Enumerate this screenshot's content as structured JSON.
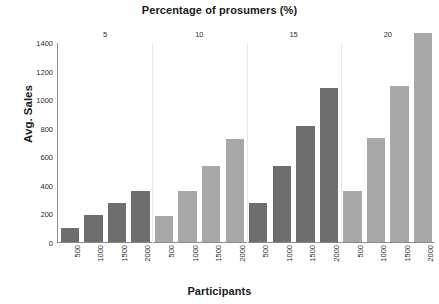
{
  "chart_data": {
    "type": "bar",
    "title": "Percentage of prosumers (%)",
    "xlabel": "Participants",
    "ylabel": "Avg. Sales",
    "ylim": [
      0,
      1400
    ],
    "yticks": [
      0,
      200,
      400,
      600,
      800,
      1000,
      1200,
      1400
    ],
    "grid": false,
    "legend": "none",
    "group_axis_label": "Percentage of prosumers (%)",
    "group_labels": [
      "5",
      "10",
      "15",
      "20"
    ],
    "categories": [
      "500",
      "1000",
      "1500",
      "2000"
    ],
    "groups": [
      {
        "name": "5",
        "color": "#6e6e6e",
        "categories": [
          "500",
          "1000",
          "1500",
          "2000"
        ],
        "values": [
          100,
          190,
          270,
          360
        ]
      },
      {
        "name": "10",
        "color": "#a8a8a8",
        "categories": [
          "500",
          "1000",
          "1500",
          "2000"
        ],
        "values": [
          185,
          360,
          530,
          720
        ]
      },
      {
        "name": "15",
        "color": "#6e6e6e",
        "categories": [
          "500",
          "1000",
          "1500",
          "2000"
        ],
        "values": [
          270,
          530,
          810,
          1080
        ]
      },
      {
        "name": "20",
        "color": "#a8a8a8",
        "categories": [
          "500",
          "1000",
          "1500",
          "2000"
        ],
        "values": [
          360,
          730,
          1090,
          1460
        ]
      }
    ],
    "colors": {
      "dark_bar": "#6e6e6e",
      "light_bar": "#a8a8a8",
      "axis": "#8a8a8a",
      "separator": "#e8e8e8",
      "text": "#1a1a1a"
    }
  }
}
